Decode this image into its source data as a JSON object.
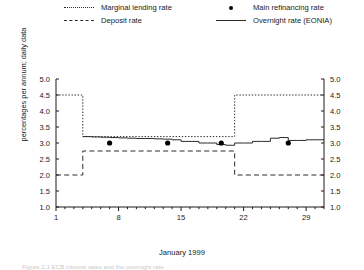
{
  "legend": {
    "items": [
      {
        "label": "Marginal lending rate",
        "key": "dotted-line",
        "color": "#2b2b2b"
      },
      {
        "label": "Deposit rate",
        "key": "dashed-line",
        "color": "#2b2b2b"
      },
      {
        "label": "Main refinancing rate",
        "key": "dot-marker",
        "color": "#000000"
      },
      {
        "label": "Overnight rate (EONIA)",
        "key": "solid-line",
        "color": "#2b2b2b"
      }
    ]
  },
  "axes": {
    "ylabel": "percentages per annum; daily data",
    "xlabel": "January 1999",
    "yticks": [
      "5.0",
      "4.5",
      "4.0",
      "3.5",
      "3.0",
      "2.5",
      "2.0",
      "1.5",
      "1.0"
    ],
    "xticks": [
      "1",
      "8",
      "15",
      "22",
      "29"
    ]
  },
  "caption": "Figure 2.1   ECB interest rates and the overnight rate",
  "chart_data": {
    "type": "line",
    "title": "",
    "xlabel": "January 1999",
    "ylabel": "percentages per annum; daily data",
    "xlim": [
      1,
      31
    ],
    "ylim": [
      1.0,
      5.0
    ],
    "ytick_values": [
      1.0,
      1.5,
      2.0,
      2.5,
      3.0,
      3.5,
      4.0,
      4.5,
      5.0
    ],
    "xtick_values": [
      1,
      8,
      15,
      22,
      29
    ],
    "grid": false,
    "legend_position": "above-plot",
    "series": [
      {
        "name": "Marginal lending rate",
        "style": "dotted",
        "color": "#2b2b2b",
        "points": [
          [
            1,
            4.5
          ],
          [
            4,
            4.5
          ],
          [
            4,
            3.2
          ],
          [
            21,
            3.2
          ],
          [
            21,
            4.5
          ],
          [
            31,
            4.5
          ]
        ]
      },
      {
        "name": "Deposit rate",
        "style": "dashed",
        "color": "#2b2b2b",
        "points": [
          [
            1,
            2.0
          ],
          [
            4,
            2.0
          ],
          [
            4,
            2.75
          ],
          [
            21,
            2.75
          ],
          [
            21,
            2.0
          ],
          [
            31,
            2.0
          ]
        ]
      },
      {
        "name": "Overnight rate (EONIA)",
        "style": "solid",
        "color": "#2b2b2b",
        "x": [
          4,
          5,
          6,
          7,
          8,
          9,
          10,
          11,
          12,
          13,
          14,
          15,
          16,
          17,
          18,
          19,
          20,
          21,
          22,
          23,
          24,
          25,
          26,
          27,
          28,
          29,
          30,
          31
        ],
        "values": [
          3.2,
          3.19,
          3.18,
          3.17,
          3.16,
          3.15,
          3.14,
          3.14,
          3.13,
          3.12,
          3.1,
          3.05,
          3.05,
          3.0,
          3.0,
          2.95,
          2.93,
          3.0,
          3.0,
          3.05,
          3.05,
          3.15,
          3.17,
          3.08,
          3.08,
          3.1,
          3.1,
          3.1
        ]
      },
      {
        "name": "Main refinancing rate",
        "style": "dots",
        "color": "#000000",
        "points": [
          [
            7,
            3.0
          ],
          [
            13.5,
            3.0
          ],
          [
            19.5,
            3.0
          ],
          [
            27,
            3.0
          ]
        ]
      }
    ]
  }
}
